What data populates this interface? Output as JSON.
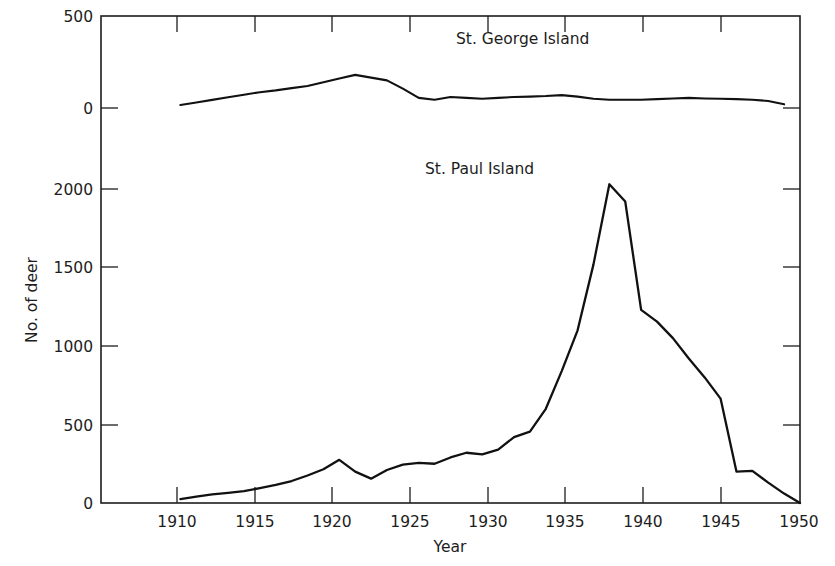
{
  "figure": {
    "background_color": "#ffffff",
    "line_color": "#111111",
    "axis_color": "#1d1d1d",
    "top_cut_fragment": "",
    "caption_fragment": ""
  },
  "chart_data": {
    "type": "line",
    "title": "",
    "xlabel": "Year",
    "ylabel": "No. of deer",
    "grid": false,
    "legend_position": "inline-annotation",
    "xlim": [
      1906,
      1950
    ],
    "x_ticks": [
      1910,
      1915,
      1920,
      1925,
      1930,
      1935,
      1940,
      1945,
      1950
    ],
    "x_tick_labels": [
      "1910",
      "1915",
      "1920",
      "1925",
      "1930",
      "1935",
      "1940",
      "1945",
      "1950"
    ],
    "panels": [
      {
        "name": "St. George Island",
        "label": "St. George Island",
        "ylim": [
          0,
          500
        ],
        "y_ticks": [
          0,
          500
        ],
        "y_tick_labels": [
          "0",
          "500"
        ],
        "series": [
          {
            "name": "St. George Island",
            "x": [
              1911,
              1912,
              1913,
              1914,
              1915,
              1916,
              1917,
              1918,
              1919,
              1920,
              1921,
              1922,
              1923,
              1924,
              1925,
              1926,
              1927,
              1928,
              1929,
              1930,
              1931,
              1932,
              1933,
              1934,
              1935,
              1936,
              1937,
              1938,
              1939,
              1940,
              1941,
              1942,
              1943,
              1944,
              1945,
              1946,
              1947,
              1948,
              1949
            ],
            "values": [
              16,
              30,
              44,
              58,
              72,
              86,
              96,
              108,
              120,
              140,
              160,
              180,
              165,
              150,
              105,
              55,
              45,
              60,
              55,
              50,
              55,
              60,
              62,
              65,
              70,
              62,
              50,
              45,
              45,
              45,
              48,
              52,
              55,
              52,
              50,
              48,
              45,
              38,
              20
            ]
          }
        ]
      },
      {
        "name": "St. Paul Island",
        "label": "St. Paul Island",
        "ylim": [
          0,
          2000
        ],
        "y_ticks": [
          0,
          500,
          1000,
          1500,
          2000
        ],
        "y_tick_labels": [
          "0",
          "500",
          "1000",
          "1500",
          "2000"
        ],
        "series": [
          {
            "name": "St. Paul Island",
            "x": [
              1911,
              1912,
              1913,
              1914,
              1915,
              1916,
              1917,
              1918,
              1919,
              1920,
              1921,
              1922,
              1923,
              1924,
              1925,
              1926,
              1927,
              1928,
              1929,
              1930,
              1931,
              1932,
              1933,
              1934,
              1935,
              1936,
              1937,
              1938,
              1939,
              1940,
              1941,
              1942,
              1943,
              1944,
              1945,
              1946,
              1947,
              1948,
              1949,
              1950
            ],
            "values": [
              25,
              40,
              55,
              65,
              75,
              95,
              115,
              140,
              175,
              215,
              275,
              200,
              155,
              210,
              245,
              255,
              250,
              290,
              320,
              310,
              340,
              420,
              455,
              600,
              840,
              1100,
              1520,
              2030,
              1920,
              1230,
              1155,
              1050,
              920,
              800,
              665,
              200,
              205,
              130,
              60,
              0
            ]
          }
        ]
      }
    ]
  }
}
